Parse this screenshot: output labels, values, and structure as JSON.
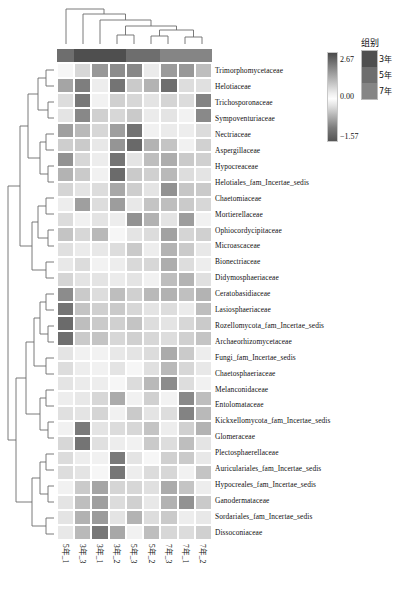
{
  "chart_data": {
    "type": "heatmap",
    "title": "",
    "xlabel": "",
    "ylabel": "",
    "grid": false,
    "legend_position": "top-right",
    "colorbar": {
      "max_label": "2.67",
      "mid_label": "0.00",
      "min_label": "−1.57",
      "max_value": 2.67,
      "mid_value": 0.0,
      "min_value": -1.57,
      "scale": "row z-score"
    },
    "group_legend": {
      "title": "组别",
      "items": [
        {
          "label": "3年",
          "color": "#4f4f4f"
        },
        {
          "label": "5年",
          "color": "#6e6e6e"
        },
        {
          "label": "7年",
          "color": "#858585"
        }
      ]
    },
    "columns": [
      "5年_1",
      "3年_3",
      "3年_1",
      "3年_2",
      "5年_3",
      "5年_2",
      "7年_3",
      "7年_1",
      "7年_2"
    ],
    "column_groups": [
      "5年",
      "3年",
      "3年",
      "3年",
      "5年",
      "5年",
      "7年",
      "7年",
      "7年"
    ],
    "column_group_colors": [
      "#6e6e6e",
      "#4f4f4f",
      "#4f4f4f",
      "#4f4f4f",
      "#6e6e6e",
      "#6e6e6e",
      "#858585",
      "#858585",
      "#858585"
    ],
    "rows": [
      "Trimorphomycetaceae",
      "Helotiaceae",
      "Trichosporonaceae",
      "Sympoventuriaceae",
      "Nectriaceae",
      "Aspergillaceae",
      "Hypocreaceae",
      "Helotiales_fam_Incertae_sedis",
      "Chaetomiaceae",
      "Mortierellaceae",
      "Ophiocordycipitaceae",
      "Microascaceae",
      "Bionectriaceae",
      "Didymosphaeriaceae",
      "Ceratobasidiaceae",
      "Lasiosphaeriaceae",
      "Rozellomycota_fam_Incertae_sedis",
      "Archaeorhizomycetaceae",
      "Fungi_fam_Incertae_sedis",
      "Chaetosphaeriaceae",
      "Melanconidaceae",
      "Entolomataceae",
      "Kickxellomycota_fam_Incertae_sedis",
      "Glomeraceae",
      "Plectosphaerellaceae",
      "Auriculariales_fam_Incertae_sedis",
      "Hypocreales_fam_Incertae_sedis",
      "Ganodermataceae",
      "Sordariales_fam_Incertae_sedis",
      "Dissoconiaceae"
    ],
    "values": [
      [
        0.05,
        -0.25,
        1.35,
        1.55,
        -0.95,
        -0.1,
        1.3,
        -0.8,
        -0.45
      ],
      [
        1.15,
        -1.05,
        0.15,
        1.95,
        -0.35,
        -0.55,
        -1.2,
        -0.2,
        0.3
      ],
      [
        -0.2,
        -1.1,
        -0.05,
        -0.3,
        -0.25,
        -0.15,
        0.45,
        0.35,
        1.7
      ],
      [
        -0.15,
        -0.95,
        -0.3,
        -0.25,
        -0.35,
        -0.1,
        -0.15,
        -0.05,
        1.6
      ],
      [
        1.25,
        -0.5,
        -0.25,
        1.25,
        -1.15,
        0.1,
        -0.1,
        0.15,
        0.35
      ],
      [
        0.55,
        -0.35,
        0.2,
        1.4,
        -1.25,
        -0.55,
        -0.4,
        0.1,
        0.5
      ],
      [
        -0.85,
        -0.25,
        0.15,
        1.95,
        0.25,
        -0.45,
        -0.6,
        -0.35,
        -0.3
      ],
      [
        -0.55,
        -0.35,
        0.1,
        2.1,
        -0.35,
        -0.3,
        -0.5,
        -0.2,
        -0.15
      ],
      [
        0.45,
        0.25,
        -0.2,
        -0.65,
        0.55,
        -0.15,
        -0.85,
        0.65,
        -0.35
      ],
      [
        0.15,
        1.25,
        -0.2,
        -0.75,
        0.2,
        -0.4,
        -0.45,
        0.6,
        -0.25
      ],
      [
        0.35,
        0.1,
        -0.15,
        0.15,
        -0.85,
        0.95,
        0.25,
        -0.75,
        0.1
      ],
      [
        -0.4,
        -0.25,
        0.85,
        0.05,
        -0.15,
        0.35,
        -0.7,
        0.45,
        -0.3
      ],
      [
        0.3,
        -0.1,
        0.2,
        -0.2,
        0.6,
        0.15,
        -0.55,
        -0.35,
        0.2
      ],
      [
        0.2,
        0.35,
        -0.05,
        0.15,
        0.4,
        -0.25,
        -0.6,
        -0.2,
        0.15
      ],
      [
        0.45,
        -0.15,
        0.25,
        -0.1,
        0.25,
        0.1,
        -0.45,
        -0.55,
        0.3
      ],
      [
        1.55,
        -0.35,
        -0.2,
        -0.45,
        -0.3,
        0.85,
        0.95,
        0.75,
        -0.55
      ],
      [
        1.95,
        -0.4,
        -0.3,
        -0.35,
        -0.25,
        -0.15,
        -0.2,
        -0.1,
        -0.45
      ],
      [
        2.1,
        -0.45,
        -0.35,
        -0.3,
        -0.4,
        -0.2,
        -0.15,
        -0.25,
        -0.35
      ],
      [
        2.05,
        -0.35,
        -0.4,
        -0.25,
        -0.3,
        -0.25,
        -0.2,
        -0.3,
        -0.4
      ],
      [
        -0.15,
        0.1,
        -0.05,
        0.2,
        0.25,
        0.35,
        1.05,
        -0.35,
        0.15
      ],
      [
        -0.2,
        0.15,
        0.1,
        0.25,
        0.05,
        0.3,
        0.85,
        -0.25,
        0.2
      ],
      [
        0.25,
        -0.1,
        0.15,
        0.05,
        0.35,
        -0.5,
        1.55,
        -0.2,
        0.1
      ],
      [
        0.15,
        0.2,
        -0.25,
        1.05,
        0.1,
        -0.3,
        -0.05,
        1.6,
        -0.45
      ],
      [
        0.3,
        -0.15,
        0.45,
        0.1,
        -0.35,
        0.25,
        -0.2,
        1.7,
        -0.5
      ],
      [
        0.1,
        1.85,
        0.25,
        0.35,
        -0.25,
        -0.4,
        0.15,
        -0.3,
        -0.55
      ],
      [
        -0.25,
        1.95,
        0.3,
        0.15,
        0.1,
        -0.35,
        -0.2,
        -0.45,
        0.25
      ],
      [
        0.35,
        0.15,
        0.1,
        1.85,
        0.25,
        0.05,
        -0.3,
        -0.35,
        0.2
      ],
      [
        -0.2,
        0.25,
        0.05,
        1.9,
        0.15,
        0.35,
        -0.25,
        0.1,
        -0.4
      ],
      [
        0.1,
        -0.35,
        1.15,
        0.45,
        -0.25,
        0.3,
        1.05,
        -0.4,
        0.15
      ],
      [
        0.25,
        -0.45,
        1.25,
        0.35,
        -0.3,
        0.2,
        0.95,
        1.45,
        -0.35
      ],
      [
        -0.15,
        0.95,
        1.3,
        0.25,
        -0.55,
        -0.2,
        -0.35,
        0.15,
        0.2
      ],
      [
        0.2,
        0.85,
        1.9,
        -0.65,
        0.1,
        -0.45,
        -0.25,
        0.35,
        -0.3
      ]
    ]
  }
}
